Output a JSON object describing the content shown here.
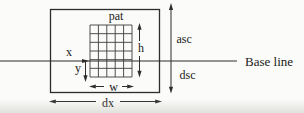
{
  "diagram": {
    "type": "glyph-metrics-figure",
    "labels": {
      "pattern": "pat",
      "origin_x": "x",
      "origin_y": "y",
      "height": "h",
      "width": "w",
      "ascent": "asc",
      "descent": "dsc",
      "advance": "dx",
      "baseline": "Base line"
    },
    "grid": {
      "columns": 5,
      "rows": 6
    },
    "colors": {
      "line": "#2d2d2d",
      "grid_line": "#3c3c3c",
      "text": "#1a1a1a",
      "background": "#fbfbf9"
    }
  }
}
